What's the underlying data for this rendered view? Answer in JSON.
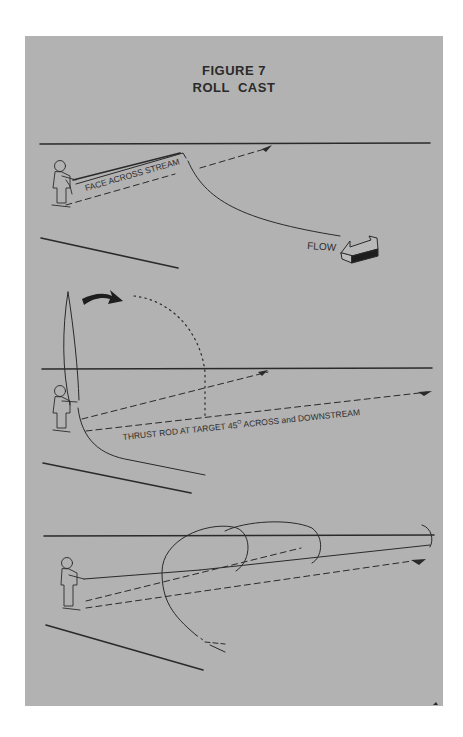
{
  "figure": {
    "number_label": "FIGURE 7",
    "title": "ROLL  CAST"
  },
  "colors": {
    "page_background": "#ffffff",
    "panel_background": "#b2b2b2",
    "ink": "#2a2a2a"
  },
  "scenes": [
    {
      "id": "step-1",
      "labels": {
        "rod_annotation": "FACE ACROSS STREAM",
        "current_label": "FLOW"
      },
      "icons": [
        "angler-figure",
        "flow-arrow-icon",
        "target-arrowhead-icon"
      ]
    },
    {
      "id": "step-2",
      "labels": {
        "instruction": "THRUST ROD AT TARGET 45",
        "degree_symbol": "O",
        "instruction_suffix": " ACROSS and DOWNSTREAM"
      },
      "icons": [
        "angler-figure",
        "curved-motion-arrow-icon",
        "target-arrowhead-icon"
      ]
    },
    {
      "id": "step-3",
      "labels": {},
      "icons": [
        "angler-figure",
        "line-loop",
        "target-arrowhead-icon"
      ]
    }
  ]
}
